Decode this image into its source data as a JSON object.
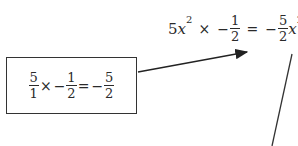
{
  "box_equation": {
    "f1": {
      "num": "5",
      "den": "1"
    },
    "op1": "×",
    "neg1": "−",
    "f2": {
      "num": "1",
      "den": "2"
    },
    "eq": "=",
    "neg2": "−",
    "f3": {
      "num": "5",
      "den": "2"
    }
  },
  "top_equation": {
    "coef": "5",
    "var": "x",
    "exp": "2",
    "op1": "×",
    "neg1": "−",
    "f1": {
      "num": "1",
      "den": "2"
    },
    "eq": "=",
    "neg2": "−",
    "f2": {
      "num": "5",
      "den": "2"
    },
    "var2": "x",
    "exp2": "2"
  },
  "colors": {
    "ink": "#2a2a2a",
    "background": "#ffffff"
  }
}
